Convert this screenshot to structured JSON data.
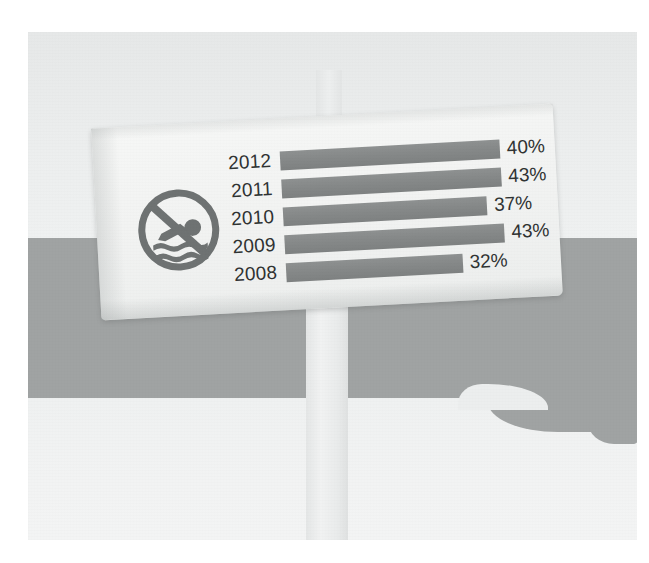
{
  "scene": {
    "title": "No swimming sign with bar chart",
    "description": "Photograph of a white signboard on a post at a beach showing a no-swimming pictogram and a horizontal bar chart of yearly percentages"
  },
  "sign": {
    "icon_name": "no-swimming-icon",
    "icon_label": "No swimming"
  },
  "chart_data": {
    "type": "bar",
    "orientation": "horizontal",
    "title": "",
    "subtitle": "",
    "xlabel": "",
    "ylabel": "",
    "categories": [
      "2012",
      "2011",
      "2010",
      "2009",
      "2008"
    ],
    "values": [
      40,
      43,
      37,
      43,
      32
    ],
    "value_labels": [
      "40%",
      "43%",
      "37%",
      "43%",
      "32%"
    ],
    "unit": "%",
    "xlim": [
      0,
      48
    ],
    "grid": false,
    "legend": false,
    "legend_position": "none",
    "bar_color": "#858888",
    "text_color": "#2f3232"
  },
  "colors": {
    "sky_band": "#eceeee",
    "water_band": "#a0a3a3",
    "sand_band": "#f2f3f3",
    "post": "#eaecec",
    "board": "#f4f5f4",
    "bar": "#858888",
    "ink": "#2f3232"
  },
  "rows": [
    {
      "year": "2012",
      "value": 40,
      "label": "40%"
    },
    {
      "year": "2011",
      "value": 43,
      "label": "43%"
    },
    {
      "year": "2010",
      "value": 37,
      "label": "37%"
    },
    {
      "year": "2009",
      "value": 43,
      "label": "43%"
    },
    {
      "year": "2008",
      "value": 32,
      "label": "32%"
    }
  ]
}
